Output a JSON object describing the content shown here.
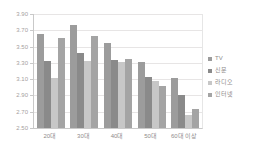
{
  "chart_data": {
    "type": "bar",
    "title": "",
    "xlabel": "",
    "ylabel": "",
    "categories": [
      "20대",
      "30대",
      "40대",
      "50대",
      "60대 이상"
    ],
    "series": [
      {
        "name": "TV",
        "color": "#9c9c9c",
        "values": [
          3.65,
          3.77,
          3.55,
          3.31,
          3.11
        ]
      },
      {
        "name": "신문",
        "color": "#8a8a8a",
        "values": [
          3.32,
          3.42,
          3.33,
          3.13,
          2.9
        ]
      },
      {
        "name": "라디오",
        "color": "#c7c7c7",
        "values": [
          3.11,
          3.32,
          3.31,
          3.08,
          2.66
        ]
      },
      {
        "name": "인터넷",
        "color": "#a4a4a4",
        "values": [
          3.61,
          3.63,
          3.35,
          3.02,
          2.73
        ]
      }
    ],
    "ylim": [
      2.5,
      3.9
    ],
    "ytick_step": 0.2,
    "ytick_labels": [
      "3.90",
      "3.70",
      "3.50",
      "3.30",
      "3.10",
      "2.90",
      "2.70",
      "2.50"
    ],
    "grid": true,
    "legend_position": "right"
  },
  "colors": {
    "background": "#ffffff",
    "gridline": "#e7e5e5",
    "axis": "#c9c9c9",
    "ytick_text": "#a6a0a0",
    "xtick_text": "#8f8b8b"
  }
}
